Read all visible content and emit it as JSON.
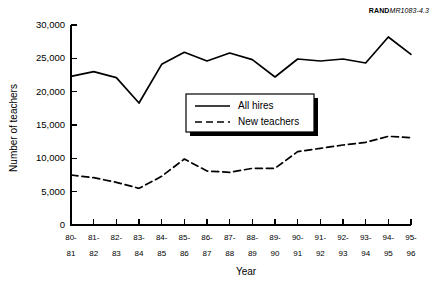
{
  "source_id": {
    "brand": "RAND",
    "code": "MR1083-4.3"
  },
  "chart_data": {
    "type": "line",
    "title": "",
    "xlabel": "Year",
    "ylabel": "Number of teachers",
    "ylim": [
      0,
      30000
    ],
    "ytick_values": [
      0,
      5000,
      10000,
      15000,
      20000,
      25000,
      30000
    ],
    "ytick_labels": [
      "0",
      "5,000",
      "10,000",
      "15,000",
      "20,000",
      "25,000",
      "30,000"
    ],
    "grid": false,
    "legend_position": "center",
    "categories": [
      "80-81",
      "81-82",
      "82-83",
      "83-84",
      "84-85",
      "85-86",
      "86-87",
      "87-88",
      "88-89",
      "89-90",
      "90-91",
      "91-92",
      "92-93",
      "93-94",
      "94-95",
      "95-96"
    ],
    "xtick_labels_top": [
      "80-",
      "81-",
      "82-",
      "83-",
      "84-",
      "85-",
      "86-",
      "87-",
      "88-",
      "89-",
      "90-",
      "91-",
      "92-",
      "93-",
      "94-",
      "95-"
    ],
    "xtick_labels_bottom": [
      "81",
      "82",
      "83",
      "84",
      "85",
      "86",
      "87",
      "88",
      "89",
      "90",
      "91",
      "92",
      "93",
      "94",
      "95",
      "96"
    ],
    "series": [
      {
        "name": "All hires",
        "style": "solid",
        "color": "#000000",
        "values": [
          22300,
          23000,
          22100,
          18300,
          24100,
          25900,
          24600,
          25800,
          24800,
          22200,
          24900,
          24600,
          24900,
          24300,
          28200,
          25600
        ]
      },
      {
        "name": "New teachers",
        "style": "dashed",
        "color": "#000000",
        "values": [
          7500,
          7100,
          6400,
          5500,
          7300,
          9900,
          8100,
          7900,
          8500,
          8500,
          11000,
          11500,
          12000,
          12400,
          13300,
          13100
        ]
      }
    ]
  }
}
